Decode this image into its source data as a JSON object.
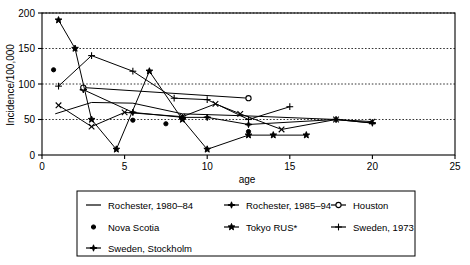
{
  "chart_data": {
    "type": "line",
    "title": "",
    "xlabel": "age",
    "ylabel": "Incidence/100,000",
    "xlim": [
      0,
      25
    ],
    "ylim": [
      0,
      200
    ],
    "xticks": [
      0,
      5,
      10,
      15,
      20,
      25
    ],
    "yticks": [
      0,
      50,
      100,
      150,
      200
    ],
    "xtick_labels": [
      "0",
      "5",
      "10",
      "15",
      "20",
      "25"
    ],
    "ytick_labels": [
      "0",
      "50",
      "100",
      "150",
      "200"
    ],
    "grid": "horizontal-dotted",
    "legend_position": "below-plot",
    "series": [
      {
        "name": "Rochester, 1980–84",
        "marker": "none",
        "line": "solid",
        "x": [
          0.8,
          3.0,
          5.5,
          8.5,
          12.5,
          17.8,
          20.0
        ],
        "y": [
          58,
          74,
          73,
          58,
          55,
          50,
          45
        ]
      },
      {
        "name": "Rochester, 1985–94",
        "marker": "star-burst",
        "line": "solid",
        "x": [
          2.5,
          5.5,
          8.5,
          10.0,
          12.5,
          17.8,
          20.0
        ],
        "y": [
          92,
          60,
          53,
          53,
          43,
          50,
          45
        ]
      },
      {
        "name": "Houston",
        "marker": "open-circle",
        "line": "solid",
        "x": [
          2.5,
          12.5
        ],
        "y": [
          95,
          80
        ]
      },
      {
        "name": "Nova Scotia",
        "marker": "filled-circle",
        "line": "none",
        "x": [
          0.7,
          5.5,
          7.5,
          12.5
        ],
        "y": [
          120,
          49,
          44,
          33
        ]
      },
      {
        "name": "Tokyo RUS*",
        "marker": "five-point-star",
        "line": "solid",
        "x": [
          1.0,
          2.0,
          3.0,
          4.5,
          6.5,
          8.5,
          10.0,
          12.5,
          14.0,
          16.0
        ],
        "y": [
          190,
          150,
          50,
          8,
          118,
          50,
          8,
          28,
          28,
          28
        ]
      },
      {
        "name": "Sweden, 1973",
        "marker": "plus",
        "line": "solid",
        "x": [
          1.0,
          3.0,
          5.5,
          8.0,
          10.0,
          12.5,
          15.0
        ],
        "y": [
          97,
          140,
          118,
          80,
          78,
          50,
          68
        ]
      },
      {
        "name": "Sweden, Stockholm",
        "marker": "x-cross",
        "line": "solid",
        "x": [
          1.0,
          3.0,
          5.0,
          8.5,
          10.5,
          12.0,
          14.5,
          17.8,
          20.0
        ],
        "y": [
          70,
          40,
          60,
          54,
          72,
          58,
          36,
          50,
          47
        ]
      }
    ]
  },
  "legend": {
    "entries": [
      {
        "label": "Rochester, 1980–84",
        "glyph": "line-plain"
      },
      {
        "label": "Rochester, 1985–94",
        "glyph": "star-burst"
      },
      {
        "label": "Houston",
        "glyph": "open-circle-line"
      },
      {
        "label": "Nova Scotia",
        "glyph": "filled-circle"
      },
      {
        "label": "Tokyo RUS*",
        "glyph": "five-point-star-line"
      },
      {
        "label": "Sweden, 1973",
        "glyph": "plus-line"
      },
      {
        "label": "Sweden, Stockholm",
        "glyph": "x-cross-line"
      }
    ]
  },
  "colors": {
    "ink": "#000000",
    "background": "#ffffff"
  }
}
